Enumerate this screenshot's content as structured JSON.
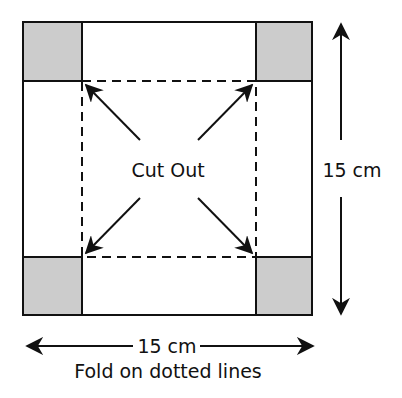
{
  "diagram": {
    "center_label": "Cut Out",
    "side_dimension": "15 cm",
    "bottom_dimension": "15 cm",
    "caption": "Fold on dotted lines",
    "colors": {
      "line": "#111111",
      "corner_fill": "#cccccc",
      "background": "#ffffff"
    },
    "corners": [
      "top-left",
      "top-right",
      "bottom-left",
      "bottom-right"
    ]
  }
}
